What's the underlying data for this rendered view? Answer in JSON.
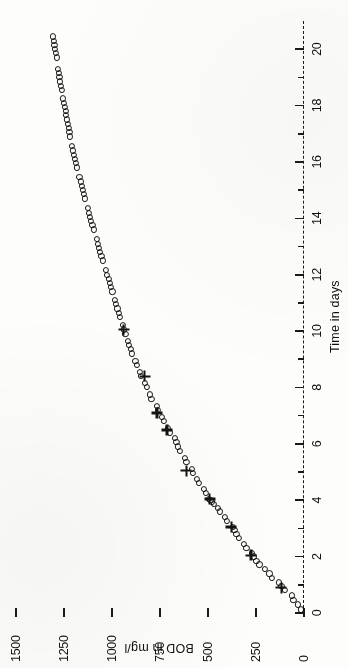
{
  "figure": {
    "background_color": "#fdfdfb",
    "ink_color": "#141414",
    "rotation_note": "90"
  },
  "chart_data": {
    "type": "scatter",
    "title": "",
    "xlabel": "Time in days",
    "ylabel": "BOD in mg/l",
    "xlim": [
      0,
      21
    ],
    "ylim": [
      0,
      1500
    ],
    "grid": false,
    "legend_position": "none",
    "x_ticks": [
      0,
      1,
      2,
      3,
      4,
      5,
      6,
      7,
      8,
      9,
      10,
      11,
      12,
      13,
      14,
      15,
      16,
      17,
      18,
      19,
      20
    ],
    "x_tick_labels": [
      "0",
      "",
      "2",
      "",
      "4",
      "",
      "6",
      "",
      "8",
      "",
      "10",
      "",
      "12",
      "",
      "14",
      "",
      "16",
      "",
      "18",
      "",
      "20"
    ],
    "y_ticks": [
      0,
      250,
      500,
      750,
      1000,
      1250,
      1500
    ],
    "y_tick_labels": [
      "0",
      "250",
      "500",
      "750",
      "1000",
      "1250",
      "1500"
    ],
    "series": [
      {
        "name": "circles",
        "marker": "o",
        "points": [
          [
            0.12,
            18
          ],
          [
            0.3,
            30
          ],
          [
            0.45,
            55
          ],
          [
            0.62,
            62
          ],
          [
            0.8,
            100
          ],
          [
            0.95,
            118
          ],
          [
            1.08,
            132
          ],
          [
            1.25,
            168
          ],
          [
            1.4,
            180
          ],
          [
            1.55,
            205
          ],
          [
            1.72,
            232
          ],
          [
            1.85,
            248
          ],
          [
            2.0,
            262
          ],
          [
            2.12,
            272
          ],
          [
            2.3,
            300
          ],
          [
            2.45,
            312
          ],
          [
            2.65,
            340
          ],
          [
            2.8,
            352
          ],
          [
            2.95,
            362
          ],
          [
            3.05,
            372
          ],
          [
            3.25,
            400
          ],
          [
            3.4,
            412
          ],
          [
            3.6,
            440
          ],
          [
            3.72,
            450
          ],
          [
            3.85,
            468
          ],
          [
            3.95,
            478
          ],
          [
            4.0,
            487
          ],
          [
            4.05,
            495
          ],
          [
            4.25,
            512
          ],
          [
            4.4,
            520
          ],
          [
            4.6,
            548
          ],
          [
            4.75,
            556
          ],
          [
            4.95,
            578
          ],
          [
            5.1,
            585
          ],
          [
            5.35,
            612
          ],
          [
            5.5,
            620
          ],
          [
            5.75,
            648
          ],
          [
            5.9,
            655
          ],
          [
            6.05,
            665
          ],
          [
            6.2,
            672
          ],
          [
            6.4,
            700
          ],
          [
            6.55,
            708
          ],
          [
            6.8,
            730
          ],
          [
            6.95,
            740
          ],
          [
            7.2,
            760
          ],
          [
            7.35,
            768
          ],
          [
            7.6,
            795
          ],
          [
            7.75,
            802
          ],
          [
            8.0,
            820
          ],
          [
            8.15,
            828
          ],
          [
            8.4,
            848
          ],
          [
            8.55,
            855
          ],
          [
            8.8,
            870
          ],
          [
            8.95,
            878
          ],
          [
            9.2,
            895
          ],
          [
            9.35,
            902
          ],
          [
            9.5,
            910
          ],
          [
            9.65,
            918
          ],
          [
            9.9,
            930
          ],
          [
            10.05,
            938
          ],
          [
            10.2,
            945
          ],
          [
            10.5,
            958
          ],
          [
            10.65,
            965
          ],
          [
            10.8,
            972
          ],
          [
            10.95,
            978
          ],
          [
            11.1,
            985
          ],
          [
            11.4,
            998
          ],
          [
            11.55,
            1005
          ],
          [
            11.7,
            1012
          ],
          [
            11.85,
            1018
          ],
          [
            12.0,
            1025
          ],
          [
            12.15,
            1032
          ],
          [
            12.5,
            1048
          ],
          [
            12.65,
            1055
          ],
          [
            12.8,
            1062
          ],
          [
            12.95,
            1068
          ],
          [
            13.1,
            1074
          ],
          [
            13.25,
            1080
          ],
          [
            13.6,
            1095
          ],
          [
            13.75,
            1102
          ],
          [
            13.9,
            1108
          ],
          [
            14.05,
            1114
          ],
          [
            14.2,
            1120
          ],
          [
            14.35,
            1126
          ],
          [
            14.7,
            1140
          ],
          [
            14.85,
            1146
          ],
          [
            15.0,
            1152
          ],
          [
            15.15,
            1158
          ],
          [
            15.3,
            1164
          ],
          [
            15.45,
            1170
          ],
          [
            15.8,
            1182
          ],
          [
            15.95,
            1188
          ],
          [
            16.1,
            1194
          ],
          [
            16.25,
            1200
          ],
          [
            16.4,
            1205
          ],
          [
            16.55,
            1210
          ],
          [
            16.9,
            1218
          ],
          [
            17.05,
            1222
          ],
          [
            17.2,
            1226
          ],
          [
            17.35,
            1230
          ],
          [
            17.5,
            1234
          ],
          [
            17.65,
            1238
          ],
          [
            17.8,
            1242
          ],
          [
            17.95,
            1246
          ],
          [
            18.1,
            1250
          ],
          [
            18.25,
            1254
          ],
          [
            18.55,
            1262
          ],
          [
            18.7,
            1266
          ],
          [
            18.85,
            1270
          ],
          [
            19.0,
            1274
          ],
          [
            19.15,
            1278
          ],
          [
            19.3,
            1281
          ],
          [
            19.7,
            1288
          ],
          [
            19.85,
            1292
          ],
          [
            20.0,
            1296
          ],
          [
            20.15,
            1300
          ],
          [
            20.3,
            1304
          ],
          [
            20.45,
            1308
          ]
        ]
      },
      {
        "name": "crosses",
        "marker": "+",
        "points": [
          [
            0.9,
            118
          ],
          [
            2.05,
            275
          ],
          [
            3.05,
            378
          ],
          [
            4.05,
            492
          ],
          [
            5.05,
            612
          ],
          [
            6.5,
            712
          ],
          [
            7.1,
            766
          ],
          [
            8.4,
            830
          ],
          [
            10.05,
            940
          ]
        ]
      }
    ]
  }
}
